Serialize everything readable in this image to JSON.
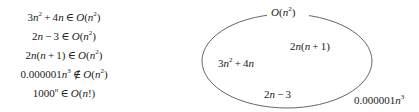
{
  "statements": [
    {
      "lhs": "3n² + 4n",
      "rel": "∈",
      "rhs": "O(n²)",
      "member": true
    },
    {
      "lhs": "2n − 3",
      "rel": "∈",
      "rhs": "O(n²)",
      "member": true
    },
    {
      "lhs": "2n(n+1)",
      "rel": "∈",
      "rhs": "O(n²)",
      "member": true
    },
    {
      "lhs": "0.000001n³",
      "rel": "∉",
      "rhs": "O(n²)",
      "member": false
    },
    {
      "lhs": "1000ⁿ",
      "rel": "∈",
      "rhs": "O(n!)",
      "member": true
    }
  ],
  "diagram": {
    "set_label": "O(n²)",
    "inside": [
      "2n(n+1)",
      "3n²+4n",
      "2n−3"
    ],
    "outside": [
      "0.000001n³"
    ],
    "stroke_color": "#555555"
  }
}
